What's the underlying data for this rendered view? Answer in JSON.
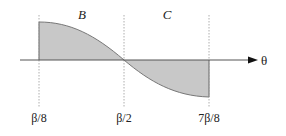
{
  "diagram": {
    "regions": [
      {
        "label": "B",
        "sign": "positive",
        "from": "β/8",
        "to": "β/2"
      },
      {
        "label": "C",
        "sign": "negative",
        "from": "β/2",
        "to": "7β/8"
      }
    ],
    "axis_label": "θ",
    "ticks": [
      "β/8",
      "β/2",
      "7β/8"
    ],
    "colors": {
      "fill": "#c8c8c8",
      "curve": "#777777",
      "axis": "#555555",
      "dashed": "#999999"
    }
  }
}
